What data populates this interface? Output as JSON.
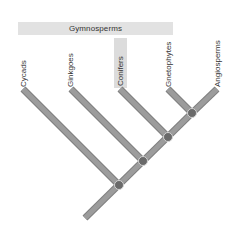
{
  "diagram": {
    "type": "cladogram",
    "group": {
      "label": "Gymnosperms",
      "color": "#e2e2e2"
    },
    "highlighted_taxon": "Conifers",
    "taxa": [
      {
        "label": "Cycads"
      },
      {
        "label": "Ginkgoes"
      },
      {
        "label": "Conifers"
      },
      {
        "label": "Gnetophytes"
      },
      {
        "label": "Angiosperms"
      }
    ],
    "colors": {
      "branch": "#9c9c9c",
      "branch_edge": "#7f7f7f",
      "node": "#6a6a6a",
      "node_ring": "#d4d4d4",
      "label_text": "#333333"
    },
    "node_count": 4
  }
}
